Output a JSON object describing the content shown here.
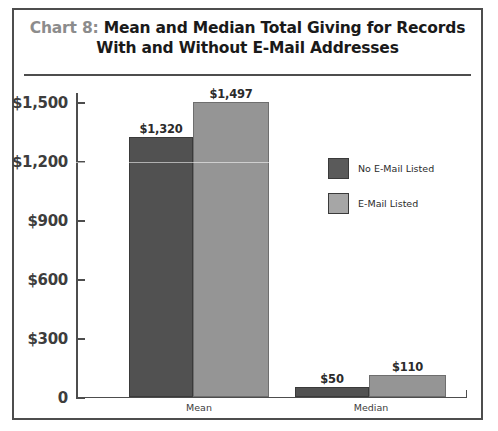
{
  "figure": {
    "title_prefix": "Chart 8:",
    "title_line1": " Mean and Median Total Giving for Records",
    "title_line2": "With and Without E-Mail Addresses"
  },
  "legend": {
    "items": [
      {
        "label": "No E-Mail Listed",
        "color": "#5a5a5a"
      },
      {
        "label": "E-Mail Listed",
        "color": "#a6a6a6"
      }
    ]
  },
  "chart_data": {
    "type": "bar",
    "title": "Chart 8: Mean and Median Total Giving for Records With and Without E-Mail Addresses",
    "categories": [
      "Mean",
      "Median"
    ],
    "series": [
      {
        "name": "No E-Mail Listed",
        "color": "#515151",
        "values": [
          1320,
          50
        ],
        "labels": [
          "$1,320",
          "$50"
        ]
      },
      {
        "name": "E-Mail Listed",
        "color": "#959595",
        "values": [
          1497,
          110
        ],
        "labels": [
          "$1,497",
          "$110"
        ]
      }
    ],
    "xlabel": "",
    "ylabel": "",
    "ylim": [
      0,
      1550
    ],
    "yticks": [
      0,
      300,
      600,
      900,
      1200,
      1500
    ],
    "ytick_labels": [
      "0",
      "$300",
      "$600",
      "$900",
      "$1,200",
      "$1,500"
    ],
    "grid": false,
    "legend_position": "center-right"
  }
}
